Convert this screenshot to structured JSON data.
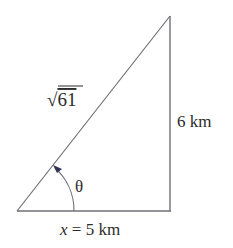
{
  "diagram": {
    "type": "right-triangle",
    "labels": {
      "hypotenuse": "61",
      "hypotenuse_prefix": "√",
      "vertical_side": "6 km",
      "base_var": "x",
      "base_eq": " = 5 km",
      "angle": "θ"
    },
    "colors": {
      "stroke": "#6f6f78",
      "arc": "#2f3550",
      "text": "#2b2b2b"
    }
  }
}
